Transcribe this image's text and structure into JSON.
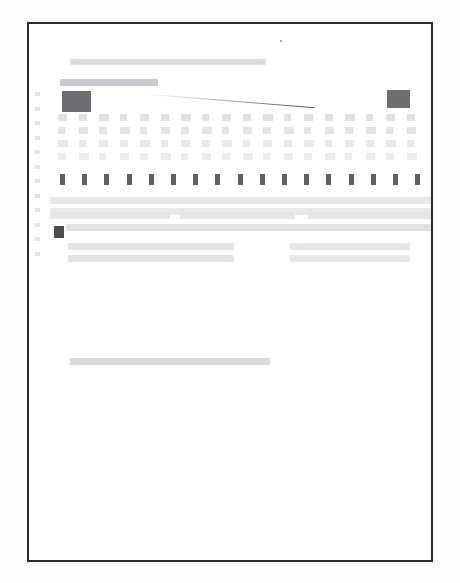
{
  "document": {
    "kind": "scanned-page",
    "legibility": "illegible",
    "note_text": "",
    "page_background": "#ffffff",
    "border_color": "#2b2b2b",
    "canvas": {
      "width": 460,
      "height": 583
    },
    "sheet": {
      "x": 27,
      "y": 22,
      "width": 406,
      "height": 540
    }
  },
  "palette": {
    "ink_dark": "#4a4a4f",
    "ink_mid": "#6e6e72",
    "ink_light": "#dfdfe4",
    "ink_faint": "#efeff2",
    "rule": "#2b2b2b"
  },
  "marks": {
    "top_speck": {
      "x": 278,
      "y": 38,
      "label": ""
    },
    "title_line": {
      "x": 68,
      "y": 57,
      "w": 196,
      "h": 6,
      "tone": "#dcdce1",
      "label": ""
    },
    "subtitle_bar": {
      "x": 58,
      "y": 77,
      "w": 98,
      "h": 7,
      "tone": "#c9c9cf",
      "label": ""
    },
    "left_block": {
      "x": 60,
      "y": 89,
      "w": 29,
      "h": 21,
      "label": ""
    },
    "right_block": {
      "x": 385,
      "y": 88,
      "w": 23,
      "h": 18,
      "label": ""
    },
    "diagonal_rule": {
      "x1": 148,
      "y1": 92,
      "x2": 312,
      "y2": 105,
      "label": ""
    },
    "bullet_marker": {
      "x": 52,
      "y": 224,
      "label": ""
    },
    "footer_line": {
      "x": 68,
      "y": 356,
      "w": 200,
      "h": 7,
      "tone": "#d9d9df",
      "label": ""
    }
  },
  "grid": {
    "label": "",
    "origin_x": 58,
    "origin_y": 114,
    "col_count": 18,
    "col_step": 20.5,
    "row_count": 4,
    "row_step": 13,
    "cell_tone": "#dfdfe4",
    "columns": [
      {
        "cells": [
          "",
          "",
          "",
          ""
        ]
      },
      {
        "cells": [
          "",
          "",
          "",
          ""
        ]
      },
      {
        "cells": [
          "",
          "",
          "",
          ""
        ]
      },
      {
        "cells": [
          "",
          "",
          "",
          ""
        ]
      },
      {
        "cells": [
          "",
          "",
          "",
          ""
        ]
      },
      {
        "cells": [
          "",
          "",
          "",
          ""
        ]
      },
      {
        "cells": [
          "",
          "",
          "",
          ""
        ]
      },
      {
        "cells": [
          "",
          "",
          "",
          ""
        ]
      },
      {
        "cells": [
          "",
          "",
          "",
          ""
        ]
      },
      {
        "cells": [
          "",
          "",
          "",
          ""
        ]
      },
      {
        "cells": [
          "",
          "",
          "",
          ""
        ]
      },
      {
        "cells": [
          "",
          "",
          "",
          ""
        ]
      },
      {
        "cells": [
          "",
          "",
          "",
          ""
        ]
      },
      {
        "cells": [
          "",
          "",
          "",
          ""
        ]
      },
      {
        "cells": [
          "",
          "",
          "",
          ""
        ]
      },
      {
        "cells": [
          "",
          "",
          "",
          ""
        ]
      },
      {
        "cells": [
          "",
          "",
          "",
          ""
        ]
      },
      {
        "cells": [
          "",
          "",
          "",
          ""
        ]
      }
    ]
  },
  "emphasis_row": {
    "label": "",
    "origin_x": 60,
    "y": 174,
    "count": 17,
    "step": 22.2,
    "values": [
      "",
      "",
      "",
      "",
      "",
      "",
      "",
      "",
      "",
      "",
      "",
      "",
      "",
      "",
      "",
      "",
      ""
    ]
  },
  "margin_ticks": {
    "x": 35,
    "start_y": 92,
    "step": 14.5,
    "count": 12,
    "values": [
      "",
      "",
      "",
      "",
      "",
      "",
      "",
      "",
      "",
      "",
      "",
      ""
    ]
  },
  "paragraph_block": {
    "label": "",
    "rows": [
      {
        "y": 197,
        "segments": [
          {
            "x": 50,
            "w": 382,
            "tone": "#e7e7eb"
          }
        ],
        "text": ""
      },
      {
        "y": 208,
        "segments": [
          {
            "x": 50,
            "w": 382,
            "tone": "#e9e9ed"
          }
        ],
        "text": ""
      },
      {
        "y": 212,
        "segments": [
          {
            "x": 50,
            "w": 120,
            "tone": "#e4e4e9"
          },
          {
            "x": 180,
            "w": 115,
            "tone": "#e4e4e9"
          },
          {
            "x": 308,
            "w": 124,
            "tone": "#e4e4e9"
          }
        ],
        "text": ""
      },
      {
        "y": 224,
        "segments": [
          {
            "x": 66,
            "w": 366,
            "tone": "#e0e0e5"
          }
        ],
        "text": ""
      },
      {
        "y": 243,
        "segments": [
          {
            "x": 68,
            "w": 166,
            "tone": "#e3e3e8"
          },
          {
            "x": 290,
            "w": 120,
            "tone": "#e6e6ea"
          }
        ],
        "text": ""
      },
      {
        "y": 255,
        "segments": [
          {
            "x": 68,
            "w": 166,
            "tone": "#e3e3e8"
          },
          {
            "x": 290,
            "w": 120,
            "tone": "#e6e6ea"
          }
        ],
        "text": ""
      }
    ]
  }
}
